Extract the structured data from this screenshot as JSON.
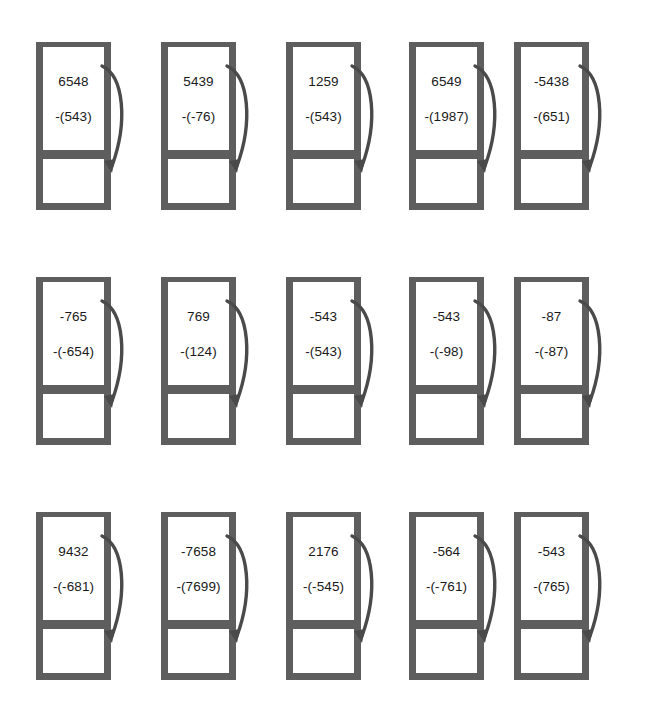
{
  "page": {
    "background_color": "#ffffff",
    "frame_color": "#5e5e5e",
    "arrow_color": "#4a4a4a",
    "text_color": "#1a1a1a",
    "columns": 5,
    "rows": 3,
    "watermark": ""
  },
  "problems": [
    [
      {
        "minuend": "6548",
        "subtrahend": "-(543)",
        "answer": ""
      },
      {
        "minuend": "5439",
        "subtrahend": "-(-76)",
        "answer": ""
      },
      {
        "minuend": "1259",
        "subtrahend": "-(543)",
        "answer": ""
      },
      {
        "minuend": "6549",
        "subtrahend": "-(1987)",
        "answer": ""
      },
      {
        "minuend": "-5438",
        "subtrahend": "-(651)",
        "answer": ""
      }
    ],
    [
      {
        "minuend": "-765",
        "subtrahend": "-(-654)",
        "answer": ""
      },
      {
        "minuend": "769",
        "subtrahend": "-(124)",
        "answer": ""
      },
      {
        "minuend": "-543",
        "subtrahend": "-(543)",
        "answer": ""
      },
      {
        "minuend": "-543",
        "subtrahend": "-(-98)",
        "answer": ""
      },
      {
        "minuend": "-87",
        "subtrahend": "-(-87)",
        "answer": ""
      }
    ],
    [
      {
        "minuend": "9432",
        "subtrahend": "-(-681)",
        "answer": ""
      },
      {
        "minuend": "-7658",
        "subtrahend": "-(7699)",
        "answer": ""
      },
      {
        "minuend": "2176",
        "subtrahend": "-(-545)",
        "answer": ""
      },
      {
        "minuend": "-564",
        "subtrahend": "-(-761)",
        "answer": ""
      },
      {
        "minuend": "-543",
        "subtrahend": "-(765)",
        "answer": ""
      }
    ]
  ]
}
